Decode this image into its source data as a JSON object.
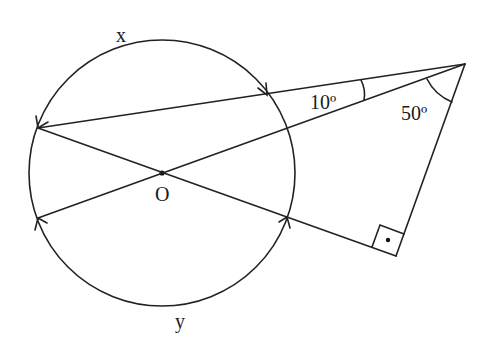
{
  "diagram": {
    "type": "circle-geometry",
    "center_label": "O",
    "arc_labels": {
      "upper": "x",
      "lower": "y"
    },
    "angle_labels": {
      "between_secants": "10º",
      "at_apex": "50º"
    },
    "right_angle_marker": true,
    "colors": {
      "stroke": "#222222",
      "background": "#ffffff",
      "text": "#1a1a1a"
    }
  }
}
